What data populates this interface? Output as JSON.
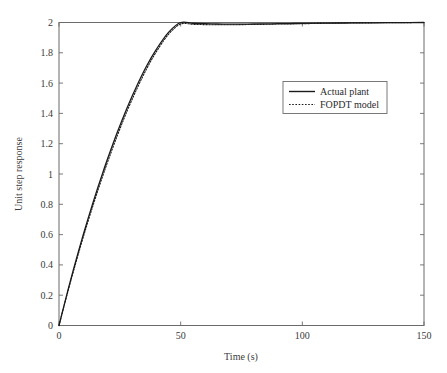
{
  "chart_data": {
    "type": "line",
    "title": "",
    "xlabel": "Time (s)",
    "ylabel": "Unit step response",
    "xlim": [
      0,
      150
    ],
    "ylim": [
      0,
      2
    ],
    "xticks": [
      0,
      50,
      100,
      150
    ],
    "xtick_labels": [
      "0",
      "50",
      "100",
      "150"
    ],
    "yticks": [
      0,
      0.2,
      0.4,
      0.6,
      0.8,
      1,
      1.2,
      1.4,
      1.6,
      1.8,
      2
    ],
    "ytick_labels": [
      "0",
      "0.2",
      "0.4",
      "0.6",
      "0.8",
      "1",
      "1.2",
      "1.4",
      "1.6",
      "1.8",
      "2"
    ],
    "grid": false,
    "legend_position": "center-right",
    "box": true,
    "tick_direction": "in",
    "series": [
      {
        "name": "Actual plant",
        "style": "solid",
        "color": "#1a1a1a",
        "x": [
          0,
          2,
          4,
          6,
          8,
          10,
          12,
          14,
          16,
          18,
          20,
          24,
          28,
          32,
          36,
          40,
          45,
          50,
          55,
          60,
          65,
          70,
          75,
          80,
          85,
          90,
          95,
          100,
          110,
          120,
          130,
          140,
          150
        ],
        "y": [
          0,
          0.128,
          0.253,
          0.373,
          0.489,
          0.601,
          0.709,
          0.813,
          0.913,
          1.009,
          1.102,
          1.277,
          1.438,
          1.583,
          1.713,
          1.823,
          1.935,
          2.0,
          1.995,
          1.992,
          1.99,
          1.989,
          1.989,
          1.99,
          1.991,
          1.992,
          1.993,
          1.994,
          1.996,
          1.997,
          1.998,
          1.999,
          2.0
        ]
      },
      {
        "name": "FOPDT model",
        "style": "dotted",
        "color": "#1a1a1a",
        "x": [
          0,
          2,
          4,
          6,
          8,
          10,
          12,
          14,
          16,
          18,
          20,
          24,
          28,
          32,
          36,
          40,
          45,
          50,
          55,
          60,
          65,
          70,
          75,
          80,
          85,
          90,
          95,
          100,
          110,
          120,
          130,
          140,
          150
        ],
        "y": [
          0,
          0.124,
          0.245,
          0.362,
          0.475,
          0.585,
          0.691,
          0.793,
          0.892,
          0.988,
          1.08,
          1.255,
          1.416,
          1.562,
          1.694,
          1.807,
          1.922,
          1.99,
          1.988,
          1.986,
          1.985,
          1.985,
          1.986,
          1.987,
          1.988,
          1.99,
          1.991,
          1.992,
          1.995,
          1.997,
          1.998,
          1.999,
          2.0
        ]
      }
    ],
    "legend": [
      {
        "label": "Actual plant",
        "style": "solid"
      },
      {
        "label": "FOPDT model",
        "style": "dotted"
      }
    ],
    "colors": {
      "axis": "#6b6b6b",
      "curve": "#1a1a1a",
      "text": "#3a3a3a",
      "background": "#ffffff"
    }
  }
}
